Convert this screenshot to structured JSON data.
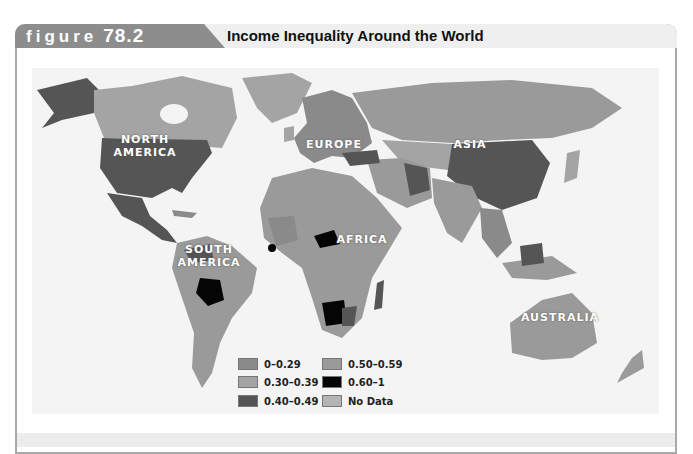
{
  "figure": {
    "label_word": "figure",
    "label_number": "78.2",
    "title": "Income Inequality Around the World"
  },
  "map": {
    "regions": [
      {
        "name": "north-america",
        "label": "NORTH\nAMERICA",
        "line1": "NORTH",
        "line2": "AMERICA"
      },
      {
        "name": "south-america",
        "line1": "SOUTH",
        "line2": "AMERICA"
      },
      {
        "name": "europe",
        "line1": "EUROPE"
      },
      {
        "name": "asia",
        "line1": "ASIA"
      },
      {
        "name": "africa",
        "line1": "AFRICA"
      },
      {
        "name": "australia",
        "line1": "AUSTRALIA"
      }
    ]
  },
  "legend": {
    "items": [
      {
        "label": "0–0.29",
        "color": "#8a8a8a"
      },
      {
        "label": "0.30–0.39",
        "color": "#a4a4a4"
      },
      {
        "label": "0.40–0.49",
        "color": "#555555"
      },
      {
        "label": "0.50–0.59",
        "color": "#9a9a9a"
      },
      {
        "label": "0.60–1",
        "color": "#050505"
      },
      {
        "label": "No Data",
        "color": "#b4b4b4"
      }
    ]
  },
  "colors": {
    "tab": "#8d8d8d",
    "header": "#efefef",
    "panel": "#f4f4f4",
    "frame": "#a8a8a8"
  }
}
